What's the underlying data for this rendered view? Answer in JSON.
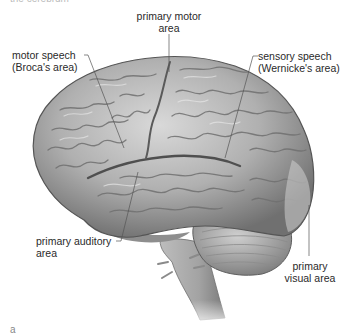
{
  "figure": {
    "title_fragment": "the cerebrum",
    "panel_letter": "a",
    "labels": {
      "primary_motor": [
        "primary motor",
        "area"
      ],
      "motor_speech": [
        "motor speech",
        "(Broca's area)"
      ],
      "sensory_speech": [
        "sensory speech",
        "(Wernicke's area)"
      ],
      "primary_auditory": [
        "primary auditory",
        "area"
      ],
      "primary_visual": [
        "primary",
        "visual area"
      ]
    },
    "colors": {
      "background": "#ffffff",
      "text": "#2a2a2a",
      "leader_line": "#555555",
      "brain_light": "#d6d6d6",
      "brain_mid": "#9e9e9e",
      "brain_dark": "#5c5c5c"
    }
  }
}
